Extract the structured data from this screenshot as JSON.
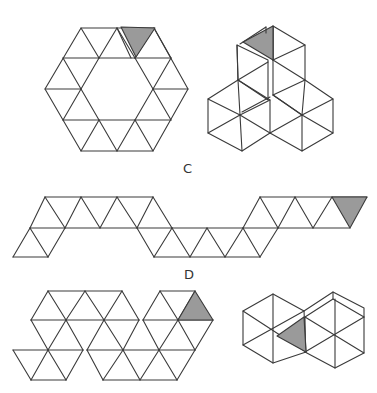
{
  "figure": {
    "type": "geometry-nets-of-triangles",
    "labels": {
      "c": "C",
      "d": "D"
    },
    "colors": {
      "line": "#3a3a3a",
      "shaded_face": "#9a9a9a",
      "background": "#ffffff"
    },
    "panels": [
      {
        "id": "net-top-hexagon-ring",
        "description": "Hexagonal ring net of 18 equilateral triangles with one shaded triangle at top"
      },
      {
        "id": "solid-top-folded",
        "description": "Folded 3D solid with one shaded face at top"
      },
      {
        "id": "net-c-strip",
        "label": "C",
        "description": "Zigzag strip net of triangles with shaded triangle at right end"
      },
      {
        "id": "net-d-hexagons",
        "label": "D",
        "description": "Net of joined hexagon groups with shaded triangle at top right"
      },
      {
        "id": "solid-d-folded",
        "description": "Folded solid with shaded face in middle"
      }
    ]
  }
}
